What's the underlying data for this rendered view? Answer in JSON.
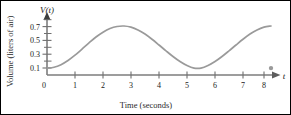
{
  "chart_data": {
    "type": "line",
    "title": "",
    "subtitle": "",
    "xlabel": "Time (seconds)",
    "ylabel": "Volume (liters of air)",
    "x_axis_symbol": "t",
    "y_axis_symbol": "V(t)",
    "xlim": [
      0,
      8.6
    ],
    "ylim": [
      0,
      0.92
    ],
    "grid": false,
    "legend": null,
    "x_ticks": [
      0,
      1,
      2,
      3,
      4,
      5,
      6,
      7,
      8
    ],
    "x_tick_labels": [
      "0",
      "1",
      "2",
      "3",
      "4",
      "5",
      "6",
      "7",
      "8"
    ],
    "y_ticks_major": [
      0.1,
      0.3,
      0.5,
      0.7
    ],
    "y_tick_labels": [
      "0.1",
      "0.3",
      "0.5",
      "0.7"
    ],
    "y_ticks_minor": [
      0.2,
      0.4,
      0.6,
      0.8
    ],
    "origin_label": "0",
    "series": [
      {
        "name": "V(t)",
        "color": "#9a9a9a",
        "x": [
          0,
          0.25,
          0.5,
          0.75,
          1,
          1.25,
          1.5,
          1.75,
          2,
          2.25,
          2.5,
          2.75,
          3,
          3.25,
          3.5,
          3.75,
          4,
          4.25,
          4.5,
          4.75,
          5,
          5.25,
          5.5,
          5.75,
          6,
          6.25,
          6.5,
          6.75,
          7,
          7.25,
          7.5,
          7.75,
          8
        ],
        "y": [
          0.1,
          0.113,
          0.15,
          0.21,
          0.287,
          0.375,
          0.465,
          0.55,
          0.62,
          0.673,
          0.703,
          0.71,
          0.693,
          0.653,
          0.593,
          0.518,
          0.435,
          0.35,
          0.268,
          0.195,
          0.137,
          0.1,
          0.1,
          0.137,
          0.195,
          0.268,
          0.35,
          0.435,
          0.518,
          0.593,
          0.653,
          0.693,
          0.71
        ]
      }
    ],
    "markers": [
      {
        "name": "curve-endpoint",
        "x": 8,
        "y": 0.1,
        "color": "#9a9a9a"
      }
    ],
    "peaks": [
      {
        "x": 2,
        "y": 0.8
      },
      {
        "x": 6,
        "y": 0.8
      }
    ],
    "valleys": [
      {
        "x": 0,
        "y": 0.1
      },
      {
        "x": 4,
        "y": 0.1
      },
      {
        "x": 8,
        "y": 0.1
      }
    ],
    "axis_color": "#7d7d7d",
    "curve_color": "#9a9a9a"
  }
}
